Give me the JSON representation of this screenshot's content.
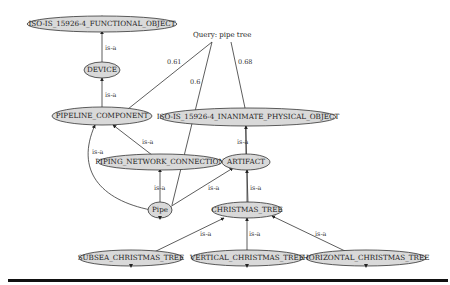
{
  "query": {
    "label": "Query: pipe tree"
  },
  "nodes": {
    "functional_object": "ISO-IS_15926-4_FUNCTIONAL_OBJECT",
    "device": "DEVICE",
    "pipeline_component": "PIPELINE_COMPONENT",
    "inanimate_physical_object": "ISO-IS_15926-4_INANIMATE_PHYSICAL_OBJECT",
    "piping_network_connection": "PIPING_NETWORK_CONNECTION",
    "artifact": "ARTIFACT",
    "pipe": "Pipe",
    "christmas_tree": "CHRISTMAS_TREE",
    "subsea_christmas_tree": "SUBSEA_CHRISTMAS_TREE",
    "vertical_christmas_tree": "VERTICAL_CHRISTMAS_TREE",
    "horizontal_christmas_tree": "HORIZONTAL_CHRISTMAS_TREE"
  },
  "edge_labels": {
    "is_a": "is-a",
    "score_pipeline_component": "0.61",
    "score_pipe": "0.6",
    "score_christmas_tree": "0.68"
  }
}
